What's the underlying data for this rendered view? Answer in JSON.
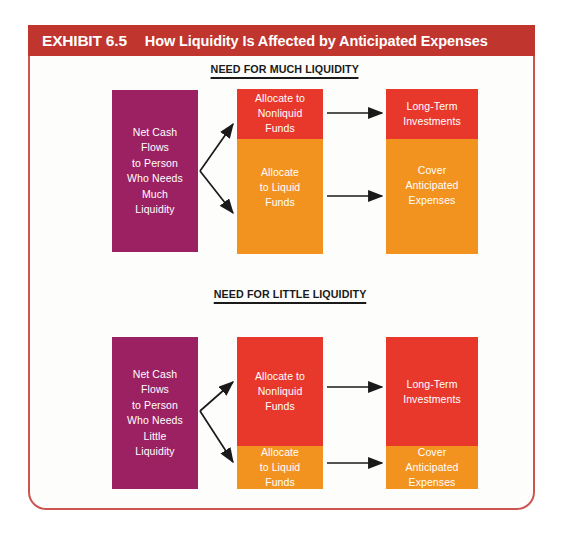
{
  "header": {
    "exhibit_label": "EXHIBIT 6.5",
    "title": "How Liquidity Is Affected by Anticipated Expenses",
    "banner_color": "#c0352e",
    "text_color": "#ffffff"
  },
  "colors": {
    "purple": "#9c2162",
    "red": "#e8382c",
    "orange": "#f3931f",
    "frame_border": "#cc5550",
    "page_background": "#fdfdfc",
    "arrow": "#1a1a1a"
  },
  "diagrams": [
    {
      "heading": "NEED FOR MUCH LIQUIDITY",
      "source_box": {
        "label": "Net Cash\nFlows\nto Person\nWho Needs\nMuch\nLiquidity",
        "color": "#9c2162"
      },
      "allocation_box": {
        "segments": [
          {
            "label": "Allocate to\nNonliquid\nFunds",
            "color": "#e8382c",
            "share_percent": 30
          },
          {
            "label": "Allocate\nto Liquid\nFunds",
            "color": "#f3931f",
            "share_percent": 70
          }
        ]
      },
      "use_box": {
        "segments": [
          {
            "label": "Long-Term\nInvestments",
            "color": "#e8382c",
            "share_percent": 30
          },
          {
            "label": "Cover\nAnticipated\nExpenses",
            "color": "#f3931f",
            "share_percent": 70
          }
        ]
      }
    },
    {
      "heading": "NEED FOR LITTLE LIQUIDITY",
      "source_box": {
        "label": "Net Cash\nFlows\nto Person\nWho Needs\nLittle\nLiquidity",
        "color": "#9c2162"
      },
      "allocation_box": {
        "segments": [
          {
            "label": "Allocate to\nNonliquid\nFunds",
            "color": "#e8382c",
            "share_percent": 72
          },
          {
            "label": "Allocate\nto Liquid\nFunds",
            "color": "#f3931f",
            "share_percent": 28
          }
        ]
      },
      "use_box": {
        "segments": [
          {
            "label": "Long-Term\nInvestments",
            "color": "#e8382c",
            "share_percent": 72
          },
          {
            "label": "Cover\nAnticipated\nExpenses",
            "color": "#f3931f",
            "share_percent": 28
          }
        ]
      }
    }
  ]
}
